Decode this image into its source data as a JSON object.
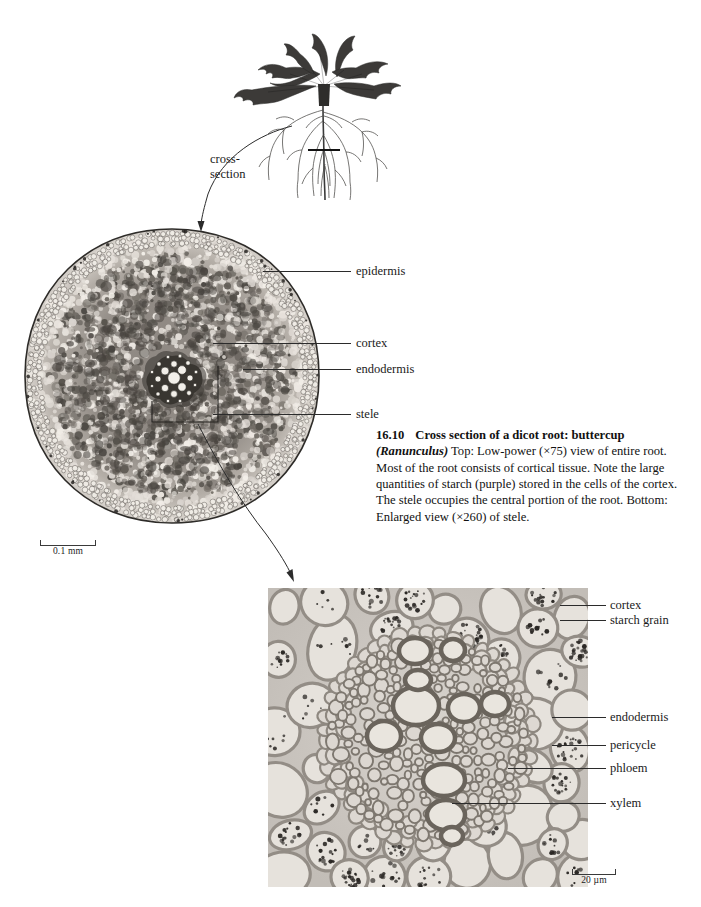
{
  "figure": {
    "number": "16.10",
    "title": "Cross section of a dicot root: buttercup",
    "species": "(Ranunculus)",
    "caption_body": "Top: Low-power (×75) view of entire root. Most of the root consists of cortical tissue. Note the large quantities of starch (purple) stored in the cells of the cortex. The stele occupies the central portion of the root. Bottom: Enlarged view (×260) of stele."
  },
  "plant": {
    "annotation_line1": "cross-",
    "annotation_line2": "section",
    "organism": "buttercup rosette plant with fibrous roots"
  },
  "top_micrograph": {
    "magnification": "×75",
    "scale_bar": "0.1 mm",
    "labels": [
      {
        "text": "epidermis"
      },
      {
        "text": "cortex"
      },
      {
        "text": "endodermis"
      },
      {
        "text": "stele"
      }
    ]
  },
  "bottom_micrograph": {
    "magnification": "×260",
    "scale_bar": "20 µm",
    "labels": [
      {
        "text": "cortex"
      },
      {
        "text": "starch grain"
      },
      {
        "text": "endodermis"
      },
      {
        "text": "pericycle"
      },
      {
        "text": "phloem"
      },
      {
        "text": "xylem"
      }
    ]
  },
  "colors": {
    "ink": "#1a1a1a",
    "leader": "#2b2b2b",
    "tissue_light": "#ddd8d2",
    "tissue_mid": "#9a948d",
    "tissue_dark": "#4a4641",
    "background": "#ffffff"
  }
}
